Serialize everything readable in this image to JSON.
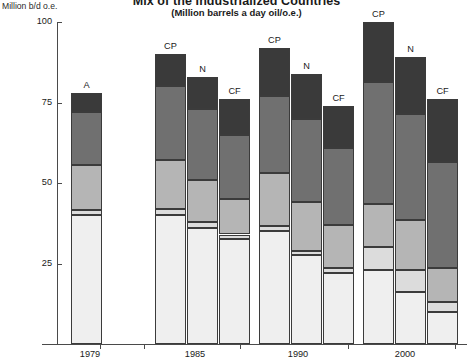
{
  "title": {
    "main": "Mix of the Industrialized Countries",
    "sub": "(Million barrels a day oil/o.e.)"
  },
  "axis": {
    "y_caption": "Million b/d o.e.",
    "y_ticks": [
      "100",
      "75",
      "50",
      "25"
    ],
    "x_ticks": [
      "1979",
      "1985",
      "1990",
      "2000"
    ]
  },
  "scenario_labels": {
    "A": "A",
    "CP": "CP",
    "N": "N",
    "CF": "CF"
  },
  "colors": {
    "nuclear_hydro": "#3a3a3a",
    "coal": "#707070",
    "gas": "#b5b5b5",
    "oil_other": "#dcdcdc",
    "oil": "#efefef",
    "axis": "#4a4a4a"
  },
  "chart_data": {
    "type": "bar",
    "stacked": true,
    "title": "Mix of the Industrialized Countries",
    "subtitle": "(Million barrels a day oil/o.e.)",
    "xlabel": "",
    "ylabel": "Million b/d o.e.",
    "ylim": [
      0,
      100
    ],
    "yticks": [
      25,
      50,
      75,
      100
    ],
    "grid": false,
    "legend": "none",
    "segment_order_bottom_to_top": [
      "oil",
      "oil_other",
      "gas",
      "coal",
      "nuclear_hydro"
    ],
    "groups": [
      {
        "year": "1979",
        "bars": [
          {
            "scenario": "A",
            "total": 78,
            "segments": [
              {
                "name": "oil",
                "value": 40.0
              },
              {
                "name": "oil_other",
                "value": 1.5
              },
              {
                "name": "gas",
                "value": 14.0
              },
              {
                "name": "coal",
                "value": 16.5
              },
              {
                "name": "nuclear_hydro",
                "value": 6.0
              }
            ]
          }
        ]
      },
      {
        "year": "1985",
        "bars": [
          {
            "scenario": "CP",
            "total": 90,
            "segments": [
              {
                "name": "oil",
                "value": 40.0
              },
              {
                "name": "oil_other",
                "value": 2.0
              },
              {
                "name": "gas",
                "value": 15.0
              },
              {
                "name": "coal",
                "value": 23.0
              },
              {
                "name": "nuclear_hydro",
                "value": 10.0
              }
            ]
          },
          {
            "scenario": "N",
            "total": 83,
            "segments": [
              {
                "name": "oil",
                "value": 36.0
              },
              {
                "name": "oil_other",
                "value": 2.0
              },
              {
                "name": "gas",
                "value": 13.0
              },
              {
                "name": "coal",
                "value": 22.0
              },
              {
                "name": "nuclear_hydro",
                "value": 10.0
              }
            ]
          },
          {
            "scenario": "CF",
            "total": 76,
            "segments": [
              {
                "name": "oil",
                "value": 32.5
              },
              {
                "name": "oil_other",
                "value": 1.5
              },
              {
                "name": "gas",
                "value": 11.0
              },
              {
                "name": "coal",
                "value": 20.0
              },
              {
                "name": "nuclear_hydro",
                "value": 11.0
              }
            ]
          }
        ]
      },
      {
        "year": "1990",
        "bars": [
          {
            "scenario": "CP",
            "total": 92,
            "segments": [
              {
                "name": "oil",
                "value": 35.0
              },
              {
                "name": "oil_other",
                "value": 1.5
              },
              {
                "name": "gas",
                "value": 16.5
              },
              {
                "name": "coal",
                "value": 24.0
              },
              {
                "name": "nuclear_hydro",
                "value": 15.0
              }
            ]
          },
          {
            "scenario": "N",
            "total": 84,
            "segments": [
              {
                "name": "oil",
                "value": 27.5
              },
              {
                "name": "oil_other",
                "value": 1.5
              },
              {
                "name": "gas",
                "value": 15.0
              },
              {
                "name": "coal",
                "value": 26.0
              },
              {
                "name": "nuclear_hydro",
                "value": 14.0
              }
            ]
          },
          {
            "scenario": "CF",
            "total": 74,
            "segments": [
              {
                "name": "oil",
                "value": 22.0
              },
              {
                "name": "oil_other",
                "value": 1.5
              },
              {
                "name": "gas",
                "value": 13.5
              },
              {
                "name": "coal",
                "value": 24.0
              },
              {
                "name": "nuclear_hydro",
                "value": 13.0
              }
            ]
          }
        ]
      },
      {
        "year": "2000",
        "bars": [
          {
            "scenario": "CP",
            "total": 100,
            "segments": [
              {
                "name": "oil",
                "value": 23.0
              },
              {
                "name": "oil_other",
                "value": 7.0
              },
              {
                "name": "gas",
                "value": 13.5
              },
              {
                "name": "coal",
                "value": 38.0
              },
              {
                "name": "nuclear_hydro",
                "value": 18.5
              }
            ]
          },
          {
            "scenario": "N",
            "total": 89,
            "segments": [
              {
                "name": "oil",
                "value": 16.0
              },
              {
                "name": "oil_other",
                "value": 7.0
              },
              {
                "name": "gas",
                "value": 15.5
              },
              {
                "name": "coal",
                "value": 33.0
              },
              {
                "name": "nuclear_hydro",
                "value": 17.5
              }
            ]
          },
          {
            "scenario": "CF",
            "total": 76,
            "segments": [
              {
                "name": "oil",
                "value": 10.0
              },
              {
                "name": "oil_other",
                "value": 3.0
              },
              {
                "name": "gas",
                "value": 10.5
              },
              {
                "name": "coal",
                "value": 33.0
              },
              {
                "name": "nuclear_hydro",
                "value": 19.5
              }
            ]
          }
        ]
      }
    ]
  },
  "layout": {
    "baseline_y": 344,
    "top_y": 22,
    "px_per_unit": 3.22,
    "bar_width": 31,
    "group_x": [
      71,
      155,
      259,
      363
    ],
    "bar_gap": 1,
    "xtick_x": [
      100,
      144,
      240,
      348,
      455
    ],
    "xlabel_center": [
      90,
      195,
      298,
      405
    ]
  }
}
